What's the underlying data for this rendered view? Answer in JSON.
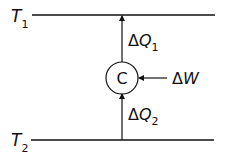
{
  "diagram": {
    "reservoirs": {
      "hot": {
        "symbol": "T",
        "subscript": "1"
      },
      "cold": {
        "symbol": "T",
        "subscript": "2"
      }
    },
    "device": {
      "label": "C"
    },
    "flows": {
      "heat_out": {
        "delta": "Δ",
        "symbol": "Q",
        "subscript": "1"
      },
      "heat_in": {
        "delta": "Δ",
        "symbol": "Q",
        "subscript": "2"
      },
      "work_in": {
        "delta": "Δ",
        "symbol": "W"
      }
    },
    "colors": {
      "stroke": "#111111",
      "background": "#ffffff"
    }
  }
}
